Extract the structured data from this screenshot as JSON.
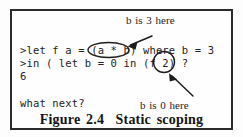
{
  "figure": {
    "caption": "Figure 2.4  Static scoping",
    "frame": {
      "border_color": "#2b2b2b",
      "background_color": "#fefefe"
    }
  },
  "transcript": {
    "lines": [
      {
        "id": "code-line-1",
        "text": ">let f a = (a * b) where b = 3"
      },
      {
        "id": "code-line-2",
        "text": ">in ( let b = 0 in (f 2) ?"
      },
      {
        "id": "code-line-3",
        "text": "6"
      },
      {
        "id": "code-line-4",
        "text": "what next?"
      }
    ]
  },
  "annotations": [
    {
      "id": "annotation-top",
      "text": "b is 3 here",
      "points_to": "a * b",
      "arrow_direction": "down-left"
    },
    {
      "id": "annotation-bottom",
      "text": "b is 0 here",
      "points_to": "f 2",
      "arrow_direction": "up-left"
    }
  ],
  "highlights": [
    {
      "id": "ellipse-a-times-b",
      "label": "a * b",
      "shape": "ellipse"
    },
    {
      "id": "ellipse-f-2",
      "label": "f 2",
      "shape": "circle"
    }
  ],
  "ink_color": "#232323"
}
